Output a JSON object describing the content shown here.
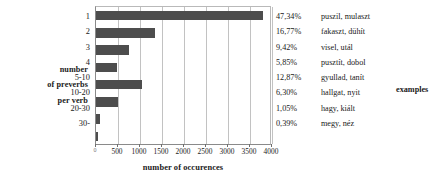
{
  "chart_data": {
    "type": "bar",
    "orientation": "horizontal",
    "title": "",
    "xlabel": "number of occurences",
    "ylabel": "number of preverbs per verb",
    "categories": [
      "1",
      "2",
      "3",
      "4",
      "5-10",
      "10-20",
      "20-30",
      "30-"
    ],
    "values": [
      3800,
      1350,
      760,
      470,
      1040,
      505,
      85,
      30
    ],
    "xlim": [
      0,
      4000
    ],
    "xticks": [
      0,
      500,
      1000,
      1500,
      2000,
      2500,
      3000,
      3500,
      4000
    ],
    "xtick_labels": [
      "0",
      "500",
      "1000",
      "1500",
      "2000",
      "2500",
      "3000",
      "3500",
      "4000"
    ],
    "grid": true,
    "legend": "none",
    "bar_color": "#4d4d4d",
    "annotations": {
      "percentages": [
        "47,34%",
        "16,77%",
        "9,42%",
        "5,85%",
        "12,87%",
        "6,30%",
        "1,05%",
        "0,39%"
      ],
      "examples": [
        "puszil, mulaszt",
        "fakaszt, dühít",
        "visel, utál",
        "pusztít, dobol",
        "gyullad, tanít",
        "hallgat, nyit",
        "hagy, kiált",
        "megy, néz"
      ]
    }
  },
  "y_axis_title_lines": [
    "number",
    "of preverbs",
    "per verb"
  ],
  "x_axis_title": "number of occurences",
  "examples_header": "examples",
  "categories": [
    "1",
    "2",
    "3",
    "4",
    "5-10",
    "10-20",
    "20-30",
    "30-"
  ],
  "percentages": [
    "47,34%",
    "16,77%",
    "9,42%",
    "5,85%",
    "12,87%",
    "6,30%",
    "1,05%",
    "0,39%"
  ],
  "examples": [
    "puszil, mulaszt",
    "fakaszt, dühít",
    "visel, utál",
    "pusztít, dobol",
    "gyullad, tanít",
    "hallgat, nyit",
    "hagy, kiált",
    "megy, néz"
  ],
  "xtick_labels": [
    "0",
    "500",
    "1000",
    "1500",
    "2000",
    "2500",
    "3000",
    "3500",
    "4000"
  ]
}
